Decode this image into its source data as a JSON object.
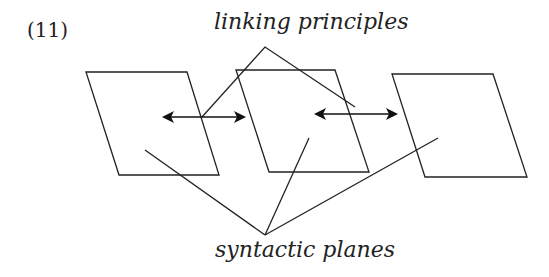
{
  "example_number": "(11)",
  "labels": {
    "top": "linking principles",
    "bottom": "syntactic planes"
  },
  "colors": {
    "stroke": "#222222",
    "background": "#ffffff"
  },
  "planes": [
    {
      "name": "plane-left",
      "points": "86,72 187,72 219,175 119,175"
    },
    {
      "name": "plane-middle",
      "points": "236,70 335,70 369,172 269,172"
    },
    {
      "name": "plane-right",
      "points": "392,74 493,74 527,177 425,177"
    }
  ],
  "arrows": [
    {
      "name": "arrow-left-middle",
      "x1": 162,
      "y1": 117,
      "x2": 246,
      "y2": 117
    },
    {
      "name": "arrow-middle-right",
      "x1": 314,
      "y1": 114,
      "x2": 398,
      "y2": 114
    }
  ]
}
